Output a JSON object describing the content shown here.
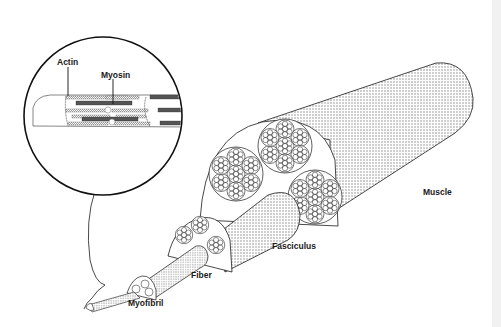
{
  "diagram": {
    "labels": {
      "actin": "Actin",
      "myosin": "Myosin",
      "muscle": "Muscle",
      "fasciculus": "Fasciculus",
      "fiber": "Fiber",
      "myofibril": "Myofibril"
    },
    "colors": {
      "line": "#1a1a1a",
      "stipple": "#8a8a8a",
      "myosin_fill": "#555555",
      "background": "#ffffff",
      "edge_strip": "#f1f1f1"
    }
  }
}
